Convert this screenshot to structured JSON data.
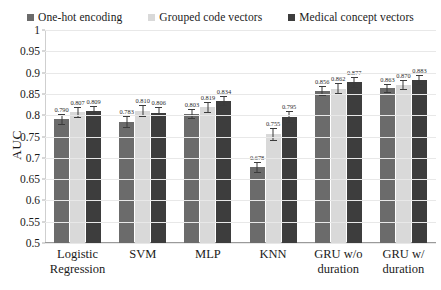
{
  "chart_data": {
    "type": "bar",
    "title": "",
    "xlabel": "",
    "ylabel": "AUC",
    "ylim": [
      0.5,
      1
    ],
    "yticks": [
      "0.5",
      "0.55",
      "0.6",
      "0.65",
      "0.7",
      "0.75",
      "0.8",
      "0.85",
      "0.9",
      "0.95",
      "1"
    ],
    "grid": true,
    "legend_position": "top",
    "categories": [
      "Logistic Regression",
      "SVM",
      "MLP",
      "KNN",
      "GRU w/o duration",
      "GRU w/ duration"
    ],
    "category_lines": [
      [
        "Logistic",
        "Regression"
      ],
      [
        "SVM"
      ],
      [
        "MLP"
      ],
      [
        "KNN"
      ],
      [
        "GRU w/o",
        "duration"
      ],
      [
        "GRU w/",
        "duration"
      ]
    ],
    "series": [
      {
        "name": "One-hot encoding",
        "color": "#6b6b6b",
        "values": [
          0.79,
          0.783,
          0.803,
          0.678,
          0.856,
          0.863
        ],
        "labels": [
          "0.790",
          "0.783",
          "0.803",
          "0.678",
          "0.856",
          "0.863"
        ],
        "errors": [
          0.012,
          0.014,
          0.011,
          0.013,
          0.012,
          0.011
        ]
      },
      {
        "name": "Grouped code vectors",
        "color": "#d9d9d9",
        "values": [
          0.807,
          0.81,
          0.819,
          0.755,
          0.862,
          0.87
        ],
        "labels": [
          "0.807",
          "0.810",
          "0.819",
          "0.755",
          "0.862",
          "0.870"
        ],
        "errors": [
          0.013,
          0.015,
          0.013,
          0.016,
          0.013,
          0.012
        ]
      },
      {
        "name": "Medical concept vectors",
        "color": "#3d3d3d",
        "values": [
          0.809,
          0.806,
          0.834,
          0.795,
          0.877,
          0.883
        ],
        "labels": [
          "0.809",
          "0.806",
          "0.834",
          "0.795",
          "0.877",
          "0.883"
        ],
        "errors": [
          0.012,
          0.013,
          0.012,
          0.014,
          0.012,
          0.011
        ]
      }
    ]
  }
}
